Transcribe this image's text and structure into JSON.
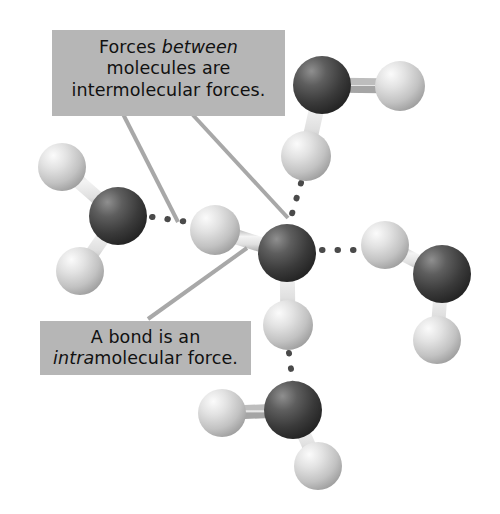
{
  "figure": {
    "background_color": "#ffffff"
  },
  "callouts": [
    {
      "id": "intermolecular",
      "name": "callout-intermolecular",
      "full_text": "Forces between molecules are intermolecular forces.",
      "lines": [
        {
          "pre": "Forces ",
          "em": "between",
          "post": ""
        },
        {
          "pre": "molecules are",
          "em": "",
          "post": ""
        },
        {
          "pre": "intermolecular forces.",
          "em": "",
          "post": ""
        }
      ],
      "box_color": "#b6b6b6",
      "text_color": "#111111",
      "rect": {
        "x": 52,
        "y": 30,
        "w": 233,
        "h": 86
      },
      "leader_lines": [
        {
          "x1": 123,
          "y1": 116,
          "x2": 177,
          "y2": 222
        },
        {
          "x1": 192,
          "y1": 116,
          "x2": 287,
          "y2": 216
        }
      ]
    },
    {
      "id": "intramolecular",
      "name": "callout-intramolecular",
      "full_text": "A bond is an intramolecular force.",
      "lines": [
        {
          "pre": "A bond is an",
          "em": "",
          "post": ""
        },
        {
          "pre": "",
          "em": "intra",
          "post": "molecular force."
        }
      ],
      "box_color": "#b6b6b6",
      "text_color": "#111111",
      "rect": {
        "x": 40,
        "y": 321,
        "w": 211,
        "h": 54
      },
      "leader_lines": [
        {
          "x1": 148,
          "y1": 318,
          "x2": 246,
          "y2": 248
        }
      ]
    }
  ],
  "legend": {
    "oxygen_label": "oxygen atom",
    "hydrogen_label": "hydrogen atom",
    "bond_label": "covalent bond (intramolecular force)",
    "hbond_label": "hydrogen bond (intermolecular force)",
    "oxygen_color": "#3b3b3b",
    "hydrogen_color": "#d8d8d8",
    "bond_color": "#dcdcdc",
    "dot_color": "#4a4a4a",
    "leader_color": "#a8a8a8"
  },
  "molecules": [
    {
      "name": "water-molecule-center",
      "oxygen": {
        "cx": 287,
        "cy": 253,
        "r": 29
      },
      "hydrogens": [
        {
          "cx": 215,
          "cy": 230,
          "r": 25
        },
        {
          "cx": 288,
          "cy": 325,
          "r": 25
        }
      ]
    },
    {
      "name": "water-molecule-left",
      "oxygen": {
        "cx": 118,
        "cy": 216,
        "r": 29
      },
      "hydrogens": [
        {
          "cx": 62,
          "cy": 167,
          "r": 24
        },
        {
          "cx": 80,
          "cy": 271,
          "r": 24
        }
      ]
    },
    {
      "name": "water-molecule-top-right",
      "oxygen": {
        "cx": 322,
        "cy": 85,
        "r": 29
      },
      "hydrogens": [
        {
          "cx": 400,
          "cy": 86,
          "r": 25
        },
        {
          "cx": 306,
          "cy": 156,
          "r": 25
        }
      ]
    },
    {
      "name": "water-molecule-right",
      "oxygen": {
        "cx": 442,
        "cy": 274,
        "r": 29
      },
      "hydrogens": [
        {
          "cx": 385,
          "cy": 245,
          "r": 24
        },
        {
          "cx": 437,
          "cy": 340,
          "r": 24
        }
      ]
    },
    {
      "name": "water-molecule-bottom",
      "oxygen": {
        "cx": 293,
        "cy": 410,
        "r": 29
      },
      "hydrogens": [
        {
          "cx": 222,
          "cy": 413,
          "r": 24
        },
        {
          "cx": 318,
          "cy": 466,
          "r": 24
        }
      ]
    }
  ],
  "hydrogen_bonds": [
    {
      "name": "hbond-left-to-center",
      "x1": 152,
      "y1": 217,
      "x2": 190,
      "y2": 222,
      "dots": 4
    },
    {
      "name": "hbond-center-to-right",
      "x1": 320,
      "y1": 250,
      "x2": 360,
      "y2": 250,
      "dots": 4
    },
    {
      "name": "hbond-topright-to-center",
      "x1": 300,
      "y1": 184,
      "x2": 290,
      "y2": 222,
      "dots": 4
    },
    {
      "name": "hbond-center-to-bottom",
      "x1": 289,
      "y1": 352,
      "x2": 292,
      "y2": 382,
      "dots": 4
    }
  ]
}
